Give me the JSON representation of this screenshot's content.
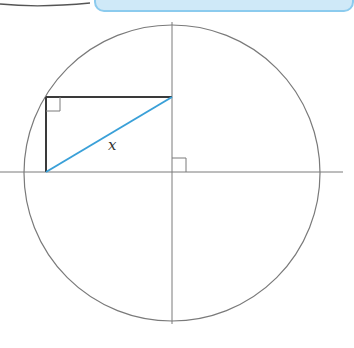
{
  "figure": {
    "type": "geometry-diagram",
    "circle": {
      "cx": 172,
      "cy": 173,
      "r": 148,
      "stroke": "#7a7a7a"
    },
    "axes": {
      "horizontal": {
        "x1": 0,
        "y1": 172,
        "x2": 343,
        "y2": 172
      },
      "vertical": {
        "x1": 172,
        "y1": 22,
        "x2": 172,
        "y2": 324
      },
      "stroke": "#7a7a7a"
    },
    "rectangle": {
      "x": 46,
      "y": 97,
      "width": 126,
      "height": 75,
      "stroke": "#3a3a3a"
    },
    "diagonal": {
      "x1": 46,
      "y1": 172,
      "x2": 172,
      "y2": 97,
      "stroke": "#3aa0d8",
      "label": "x"
    },
    "right_angle_markers": [
      {
        "at": "rectangle-top-left-corner",
        "x": 46,
        "y": 97,
        "size": 14
      },
      {
        "at": "center-axes-intersection",
        "x": 172,
        "y": 172,
        "size": 14
      }
    ]
  },
  "header_fragment": {
    "left_curve_color": "#555555",
    "banner_color": "#cfe9f8",
    "banner_border": "#8ccbee"
  }
}
